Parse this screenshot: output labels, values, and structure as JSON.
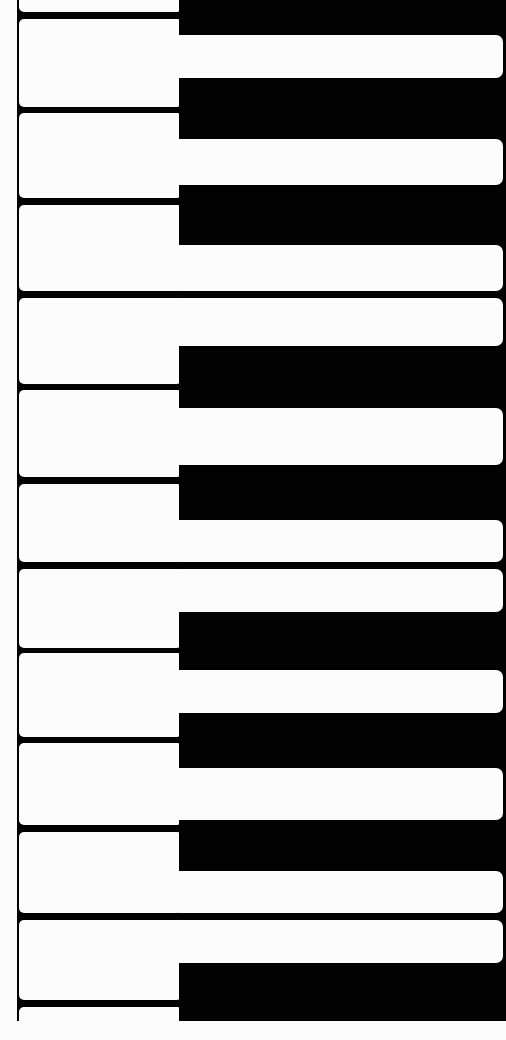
{
  "image": {
    "description": "Top-down close-up of piano keys rotated 90°, white keys running horizontally over a black keyboard body",
    "colors": {
      "white_key": "#fcfcfc",
      "black": "#020202",
      "background": "#fbfbfb"
    }
  },
  "keyboard": {
    "left_edge_x": 17,
    "wide_x": [
      19,
      178
    ],
    "stem_x": [
      178,
      503
    ],
    "white_keys": [
      {
        "id": "key-0",
        "wide": [
          -20,
          12
        ],
        "stem": null
      },
      {
        "id": "key-1",
        "wide": [
          19,
          107
        ],
        "stem": [
          35,
          78
        ]
      },
      {
        "id": "key-2",
        "wide": [
          113,
          198
        ],
        "stem": [
          139,
          185
        ]
      },
      {
        "id": "key-3",
        "wide": [
          205,
          291
        ],
        "stem": [
          245,
          291
        ]
      },
      {
        "id": "key-4",
        "wide": [
          298,
          384
        ],
        "stem": [
          298,
          346
        ]
      },
      {
        "id": "key-5",
        "wide": [
          390,
          477
        ],
        "stem": [
          408,
          465
        ]
      },
      {
        "id": "key-6",
        "wide": [
          484,
          562
        ],
        "stem": [
          520,
          562
        ]
      },
      {
        "id": "key-7",
        "wide": [
          569,
          648
        ],
        "stem": [
          569,
          612
        ]
      },
      {
        "id": "key-8",
        "wide": [
          653,
          737
        ],
        "stem": [
          670,
          713
        ]
      },
      {
        "id": "key-9",
        "wide": [
          743,
          825
        ],
        "stem": [
          768,
          820
        ]
      },
      {
        "id": "key-10",
        "wide": [
          832,
          913
        ],
        "stem": [
          871,
          913
        ]
      },
      {
        "id": "key-11",
        "wide": [
          920,
          1000
        ],
        "stem": [
          920,
          963
        ]
      },
      {
        "id": "key-12",
        "wide": [
          1007,
          1040
        ],
        "stem": null
      }
    ],
    "black_keys": [
      {
        "id": "black-0",
        "y": [
          0,
          35
        ]
      },
      {
        "id": "black-1",
        "y": [
          78,
          139
        ]
      },
      {
        "id": "black-2",
        "y": [
          185,
          245
        ]
      },
      {
        "id": "black-3",
        "y": [
          346,
          408
        ]
      },
      {
        "id": "black-4",
        "y": [
          465,
          520
        ]
      },
      {
        "id": "black-5",
        "y": [
          612,
          670
        ]
      },
      {
        "id": "black-6",
        "y": [
          713,
          768
        ]
      },
      {
        "id": "black-7",
        "y": [
          820,
          871
        ]
      },
      {
        "id": "black-8",
        "y": [
          963,
          1021
        ]
      }
    ]
  }
}
